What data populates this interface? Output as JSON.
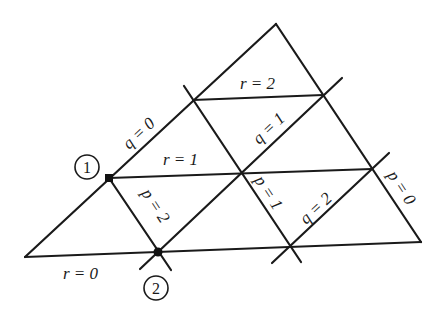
{
  "diagram": {
    "type": "triangular-coordinate-grid",
    "vertices": {
      "top": [
        276,
        24
      ],
      "bottom_left": [
        25,
        257
      ],
      "bottom_right": [
        421,
        242
      ]
    },
    "lines": {
      "r": [
        {
          "label": "r = 0",
          "from": [
            25,
            257
          ],
          "to": [
            421,
            242
          ]
        },
        {
          "label": "r = 1",
          "from": [
            109,
            178
          ],
          "to": [
            372,
            169
          ]
        },
        {
          "label": "r = 2",
          "from": [
            193,
            100
          ],
          "to": [
            323,
            95
          ]
        }
      ],
      "q": [
        {
          "label": "q = 0",
          "from": [
            25,
            257
          ],
          "to": [
            276,
            24
          ]
        },
        {
          "label": "q = 1",
          "from": [
            158,
            252
          ],
          "to": [
            342,
            78
          ]
        },
        {
          "label": "q = 2",
          "from": [
            272,
            263
          ],
          "to": [
            389,
            153
          ]
        }
      ],
      "p": [
        {
          "label": "p = 0",
          "from": [
            276,
            24
          ],
          "to": [
            421,
            242
          ]
        },
        {
          "label": "p = 1",
          "from": [
            184,
            86
          ],
          "to": [
            301,
            262
          ]
        },
        {
          "label": "p = 2",
          "from": [
            109,
            178
          ],
          "to": [
            170,
            268
          ]
        }
      ]
    },
    "labels": {
      "r0": "r = 0",
      "r1": "r = 1",
      "r2": "r = 2",
      "q0": "q = 0",
      "q1": "q = 1",
      "q2": "q = 2",
      "p0": "p = 0",
      "p1": "p = 1",
      "p2": "p = 2"
    },
    "points": [
      {
        "id": "1",
        "label": "1",
        "position": [
          109,
          178
        ],
        "marker_circle": [
          87,
          167
        ]
      },
      {
        "id": "2",
        "label": "2",
        "position": [
          158,
          252
        ],
        "marker_circle": [
          156,
          288
        ]
      }
    ]
  }
}
